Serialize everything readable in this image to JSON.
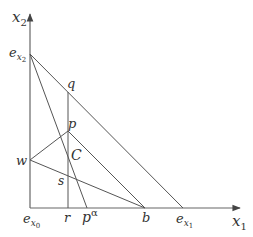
{
  "diagram": {
    "axes": {
      "x_label": "x",
      "x_sub": "1",
      "y_label": "x",
      "y_sub": "2"
    },
    "points": {
      "e_x2": {
        "label": "e",
        "sub": "x",
        "subsub": "2"
      },
      "e_x0": {
        "label": "e",
        "sub": "x",
        "subsub": "0"
      },
      "e_x1": {
        "label": "e",
        "sub": "x",
        "subsub": "1"
      },
      "q": {
        "label": "q"
      },
      "p": {
        "label": "p"
      },
      "C": {
        "label": "C"
      },
      "w": {
        "label": "w"
      },
      "s": {
        "label": "s"
      },
      "r": {
        "label": "r"
      },
      "p_alpha": {
        "label": "p",
        "sup": "α"
      },
      "b": {
        "label": "b"
      }
    },
    "line_color": "#555555"
  }
}
